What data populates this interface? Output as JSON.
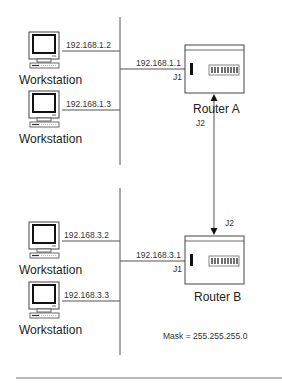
{
  "diagram": {
    "type": "network-topology",
    "subnet_a": {
      "router": {
        "label": "Router A",
        "port_j1_label": "J1",
        "port_j2_label": "J2",
        "j1_ip": "192.168.1.1"
      },
      "workstations": [
        {
          "label": "Workstation",
          "ip": "192.168.1.2"
        },
        {
          "label": "Workstation",
          "ip": "192.168.1.3"
        }
      ]
    },
    "subnet_b": {
      "router": {
        "label": "Router B",
        "port_j1_label": "J1",
        "port_j2_label": "J2",
        "j1_ip": "192.168.3.1"
      },
      "workstations": [
        {
          "label": "Workstation",
          "ip": "192.168.3.2"
        },
        {
          "label": "Workstation",
          "ip": "192.168.3.3"
        }
      ]
    },
    "link": {
      "from": "Router A J2",
      "to": "Router B J2",
      "style": "double-arrow"
    },
    "mask_note": "Mask = 255.255.255.0",
    "colors": {
      "line": "#555555",
      "text": "#222222",
      "background": "#ffffff"
    }
  }
}
